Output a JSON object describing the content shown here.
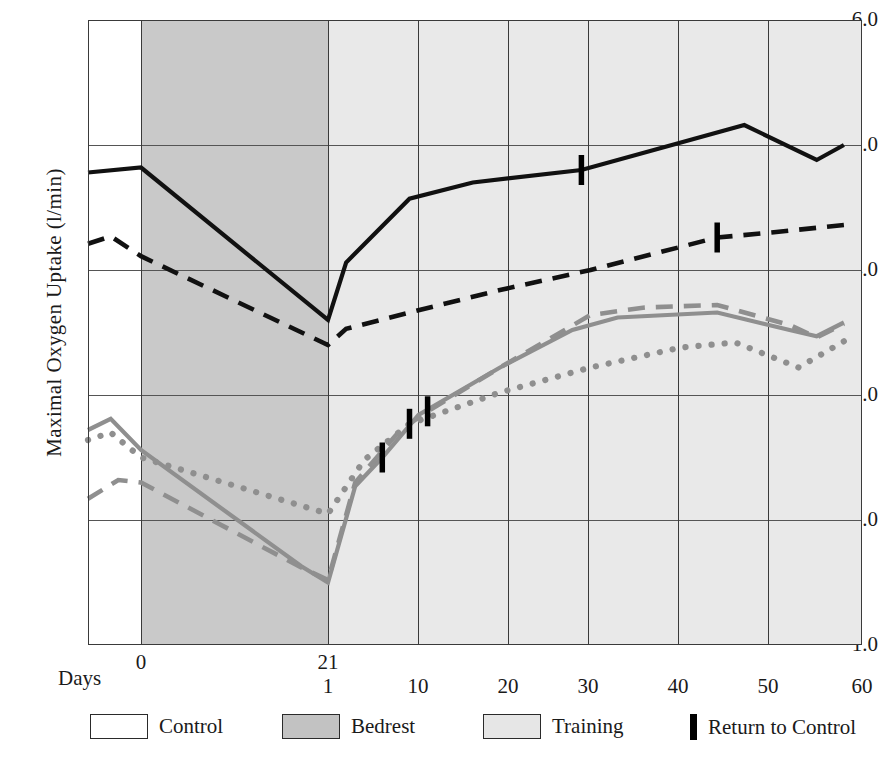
{
  "axes": {
    "ylabel": "Maximal Oxygen Uptake (l/min)",
    "xlabel": "Days",
    "yticks": [
      "6.0",
      "5.0",
      "4.0",
      "3.0",
      "2.0",
      "1.0"
    ],
    "xticks_top": [
      "0",
      "21"
    ],
    "xticks_bottom": [
      "1",
      "10",
      "20",
      "30",
      "40",
      "50",
      "60"
    ]
  },
  "legend": {
    "control": "Control",
    "bedrest": "Bedrest",
    "training": "Training",
    "return": "Return to Control"
  },
  "colors": {
    "black": "#111111",
    "gray": "#8f8f8f",
    "bedrest_band": "#c9c9c9",
    "training_band": "#e9e9e9",
    "control_band": "#ffffff",
    "grid": "#555555",
    "marker": "#000000"
  },
  "chart_data": {
    "type": "line",
    "title": "",
    "xlabel": "Days",
    "ylabel": "Maximal Oxygen Uptake (l/min)",
    "ylim": [
      1.0,
      6.0
    ],
    "grid": true,
    "legend_position": "below-axis",
    "phases": [
      {
        "name": "Control",
        "x_from": -7,
        "x_to": 0,
        "shade": "#ffffff"
      },
      {
        "name": "Bedrest",
        "x_from": 0,
        "x_to": 21,
        "shade": "#c9c9c9"
      },
      {
        "name": "Training",
        "x_from": 21,
        "x_to": 60,
        "shade": "#e9e9e9"
      }
    ],
    "x_axis_note": "Bedrest days 0-21 then training days 1-60 restart at the 21 gridline",
    "series": [
      {
        "name": "Subject A (solid black)",
        "style": "solid",
        "color": "#111111",
        "points": [
          {
            "phase": "control",
            "x": -7,
            "y": 4.78
          },
          {
            "phase": "control",
            "x": 0,
            "y": 4.82
          },
          {
            "phase": "bedrest",
            "x": 21,
            "y": 3.6
          },
          {
            "phase": "training",
            "x": 1,
            "y": 3.6
          },
          {
            "phase": "training",
            "x": 3,
            "y": 4.06
          },
          {
            "phase": "training",
            "x": 10,
            "y": 4.57
          },
          {
            "phase": "training",
            "x": 17,
            "y": 4.7
          },
          {
            "phase": "training",
            "x": 29,
            "y": 4.8
          },
          {
            "phase": "training",
            "x": 35,
            "y": 4.92
          },
          {
            "phase": "training",
            "x": 47,
            "y": 5.16
          },
          {
            "phase": "training",
            "x": 55,
            "y": 4.88
          },
          {
            "phase": "training",
            "x": 58,
            "y": 5.0
          }
        ],
        "return_to_control_marker": {
          "x": 29,
          "y": 4.8
        }
      },
      {
        "name": "Subject B (dashed black)",
        "style": "dashed",
        "color": "#111111",
        "points": [
          {
            "phase": "control",
            "x": -7,
            "y": 4.21
          },
          {
            "phase": "control",
            "x": -4,
            "y": 4.27
          },
          {
            "phase": "control",
            "x": 0,
            "y": 4.11
          },
          {
            "phase": "bedrest",
            "x": 21,
            "y": 3.4
          },
          {
            "phase": "training",
            "x": 1,
            "y": 3.4
          },
          {
            "phase": "training",
            "x": 3,
            "y": 3.53
          },
          {
            "phase": "training",
            "x": 10,
            "y": 3.66
          },
          {
            "phase": "training",
            "x": 20,
            "y": 3.84
          },
          {
            "phase": "training",
            "x": 30,
            "y": 4.0
          },
          {
            "phase": "training",
            "x": 44,
            "y": 4.26
          },
          {
            "phase": "training",
            "x": 50,
            "y": 4.3
          },
          {
            "phase": "training",
            "x": 58,
            "y": 4.36
          }
        ],
        "return_to_control_marker": {
          "x": 44,
          "y": 4.26
        }
      },
      {
        "name": "Subject C (solid gray)",
        "style": "solid",
        "color": "#8f8f8f",
        "points": [
          {
            "phase": "control",
            "x": -7,
            "y": 2.72
          },
          {
            "phase": "control",
            "x": -4,
            "y": 2.81
          },
          {
            "phase": "control",
            "x": 0,
            "y": 2.56
          },
          {
            "phase": "bedrest",
            "x": 18,
            "y": 1.63
          },
          {
            "phase": "bedrest",
            "x": 21,
            "y": 1.5
          },
          {
            "phase": "training",
            "x": 1,
            "y": 1.5
          },
          {
            "phase": "training",
            "x": 4,
            "y": 2.27
          },
          {
            "phase": "training",
            "x": 7,
            "y": 2.5
          },
          {
            "phase": "training",
            "x": 11,
            "y": 2.84
          },
          {
            "phase": "training",
            "x": 20,
            "y": 3.22
          },
          {
            "phase": "training",
            "x": 28,
            "y": 3.52
          },
          {
            "phase": "training",
            "x": 33,
            "y": 3.62
          },
          {
            "phase": "training",
            "x": 44,
            "y": 3.66
          },
          {
            "phase": "training",
            "x": 52,
            "y": 3.52
          },
          {
            "phase": "training",
            "x": 55,
            "y": 3.47
          },
          {
            "phase": "training",
            "x": 58,
            "y": 3.58
          }
        ],
        "return_to_control_marker": {
          "x": 7,
          "y": 2.5
        }
      },
      {
        "name": "Subject D (dashed gray)",
        "style": "dashed",
        "color": "#8f8f8f",
        "points": [
          {
            "phase": "control",
            "x": -7,
            "y": 2.17
          },
          {
            "phase": "control",
            "x": -3,
            "y": 2.32
          },
          {
            "phase": "control",
            "x": 0,
            "y": 2.3
          },
          {
            "phase": "bedrest",
            "x": 18,
            "y": 1.62
          },
          {
            "phase": "bedrest",
            "x": 21,
            "y": 1.52
          },
          {
            "phase": "training",
            "x": 1,
            "y": 1.52
          },
          {
            "phase": "training",
            "x": 4,
            "y": 2.3
          },
          {
            "phase": "training",
            "x": 9,
            "y": 2.72
          },
          {
            "phase": "training",
            "x": 12,
            "y": 2.87
          },
          {
            "phase": "training",
            "x": 20,
            "y": 3.22
          },
          {
            "phase": "training",
            "x": 30,
            "y": 3.64
          },
          {
            "phase": "training",
            "x": 36,
            "y": 3.7
          },
          {
            "phase": "training",
            "x": 44,
            "y": 3.72
          },
          {
            "phase": "training",
            "x": 52,
            "y": 3.56
          },
          {
            "phase": "training",
            "x": 55,
            "y": 3.46
          },
          {
            "phase": "training",
            "x": 58,
            "y": 3.57
          }
        ],
        "return_to_control_marker": {
          "x": 12,
          "y": 2.87
        }
      },
      {
        "name": "Subject E (dotted gray)",
        "style": "dotted",
        "color": "#8f8f8f",
        "points": [
          {
            "phase": "control",
            "x": -7,
            "y": 2.64
          },
          {
            "phase": "control",
            "x": -4,
            "y": 2.7
          },
          {
            "phase": "control",
            "x": 0,
            "y": 2.5
          },
          {
            "phase": "bedrest",
            "x": 21,
            "y": 2.05
          },
          {
            "phase": "training",
            "x": 1,
            "y": 2.05
          },
          {
            "phase": "training",
            "x": 5,
            "y": 2.48
          },
          {
            "phase": "training",
            "x": 10,
            "y": 2.77
          },
          {
            "phase": "training",
            "x": 20,
            "y": 3.02
          },
          {
            "phase": "training",
            "x": 30,
            "y": 3.22
          },
          {
            "phase": "training",
            "x": 40,
            "y": 3.38
          },
          {
            "phase": "training",
            "x": 46,
            "y": 3.42
          },
          {
            "phase": "training",
            "x": 53,
            "y": 3.22
          },
          {
            "phase": "training",
            "x": 58,
            "y": 3.43
          }
        ],
        "return_to_control_marker": {
          "x": 10,
          "y": 2.77
        }
      }
    ],
    "markers_note": "Short vertical black bars mark each subject's return to control VO2max"
  }
}
